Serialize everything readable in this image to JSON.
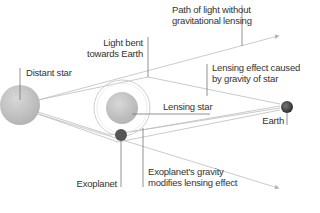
{
  "diagram": {
    "labels": {
      "path_without_lensing": [
        "Path of light without",
        "gravitational lensing"
      ],
      "light_bent": [
        "Light bent",
        "towards Earth"
      ],
      "distant_star": "Distant star",
      "lensing_effect": [
        "Lensing effect caused",
        "by gravity of star"
      ],
      "lensing_star": "Lensing star",
      "earth": "Earth",
      "exoplanet": "Exoplanet",
      "exoplanet_gravity": [
        "Exoplanet's gravity",
        "modifies lensing effect"
      ]
    },
    "bodies": {
      "distant_star": {
        "name": "Distant star",
        "color": "#c8c8c8"
      },
      "lensing_star": {
        "name": "Lensing star",
        "color": "#c4c4c4"
      },
      "exoplanet": {
        "name": "Exoplanet",
        "color": "#555555"
      },
      "earth": {
        "name": "Earth",
        "color": "#444444"
      }
    },
    "colors": {
      "line": "#b9b9b9",
      "leader": "#666666",
      "text": "#333333"
    }
  }
}
